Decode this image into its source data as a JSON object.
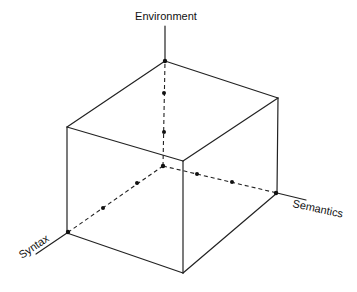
{
  "diagram": {
    "title": "",
    "type": "3d-cube-axes",
    "colors": {
      "background": "#ffffff",
      "line": "#222222",
      "text": "#111111"
    },
    "axes": {
      "environment": {
        "label": "Environment",
        "direction": "up"
      },
      "syntax": {
        "label": "Syntax",
        "direction": "down-left"
      },
      "semantics": {
        "label": "Semantics",
        "direction": "right"
      }
    },
    "origin": {
      "x": 163,
      "y": 166
    },
    "axis_tick_dots_per_axis": 2,
    "cube_vertices": {
      "back_top": {
        "x": 165,
        "y": 61
      },
      "left_top": {
        "x": 67,
        "y": 127
      },
      "right_top": {
        "x": 278,
        "y": 98
      },
      "front_top": {
        "x": 183,
        "y": 161
      },
      "left_bottom": {
        "x": 67,
        "y": 233
      },
      "right_bottom": {
        "x": 277,
        "y": 193
      },
      "front_bottom": {
        "x": 183,
        "y": 273
      },
      "origin_hidden": {
        "x": 163,
        "y": 166
      }
    }
  }
}
